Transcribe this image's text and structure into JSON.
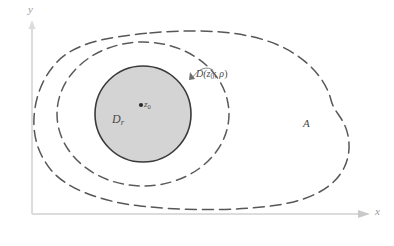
{
  "figure": {
    "background_color": "#ffffff",
    "width": 394,
    "height": 246,
    "axes": {
      "color": "#d8d8d8",
      "y_label": "y",
      "x_label": "x",
      "y_axis_name": "y-axis",
      "x_axis_name": "x-axis"
    },
    "regions": {
      "outer": {
        "label": "A",
        "style": "dashed",
        "fill": "none",
        "stroke": "#555555",
        "description": "open-set-blob"
      },
      "middle": {
        "label_prefix": "D(",
        "label_center": "z",
        "label_center_sub": "0",
        "label_sep": "; ",
        "label_radius": "ρ",
        "label_suffix": ")",
        "label_full": "D(z0; ρ)",
        "style": "dashed",
        "fill": "none",
        "stroke": "#555555",
        "description": "open-disk-rho"
      },
      "inner": {
        "label_main": "D",
        "label_sub": "r",
        "label_full": "Dr",
        "style": "solid",
        "fill": "#d4d4d4",
        "stroke": "#3a3a3a",
        "description": "closed-disk-r"
      }
    },
    "center_point": {
      "marker": "dot",
      "label_main": "z",
      "label_sub": "0",
      "label_full": "z0"
    },
    "leader_line": {
      "name": "callout-arc",
      "stroke": "#777777"
    }
  }
}
